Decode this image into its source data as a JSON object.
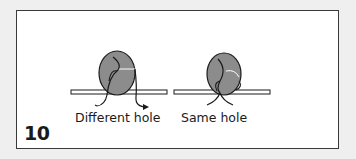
{
  "figure": {
    "step_number": "10",
    "panels": [
      {
        "id": "different-hole",
        "caption": "Different hole"
      },
      {
        "id": "same-hole",
        "caption": "Same hole"
      }
    ]
  },
  "colors": {
    "background": "#efefef",
    "frame_fill": "#ffffff",
    "frame_border": "#3a3a3a",
    "button_fill": "#8c8c8c",
    "line": "#1a1a1a"
  }
}
